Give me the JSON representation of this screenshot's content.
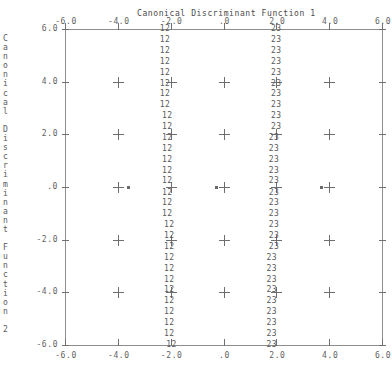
{
  "title": "Canonical Discriminant Function 1",
  "y_axis_caption": "Canonical Discriminant Function 2",
  "y_axis_caption_chars": [
    "C",
    "a",
    "n",
    "o",
    "n",
    "i",
    "c",
    "a",
    "l",
    "",
    "D",
    "i",
    "s",
    "c",
    "r",
    "i",
    "m",
    "i",
    "n",
    "a",
    "n",
    "t",
    "",
    "F",
    "u",
    "n",
    "c",
    "t",
    "i",
    "o",
    "n",
    "",
    "2"
  ],
  "x_tick_labels": [
    "-6.0",
    "-4.0",
    "-2.0",
    ".0",
    "2.0",
    "4.0",
    "6.0"
  ],
  "y_tick_labels": [
    "6.0",
    "4.0",
    "2.0",
    ".0",
    "-2.0",
    "-4.0",
    "-6.0"
  ],
  "x_tick_labels_top": [
    "-6.0",
    "-4.0",
    "-2.0",
    ".0",
    "2.0",
    "4.0",
    "6.0"
  ],
  "symbols": {
    "group_12": "12",
    "group_23": "23",
    "grid_marker": "+",
    "centroid": "*"
  },
  "colors": {
    "axis": "#8d8d8d",
    "tick": "#707070",
    "text": "#5a5a5a",
    "marker": "#6e6e6e",
    "background": "#ffffff"
  },
  "chart_data": {
    "type": "scatter",
    "title": "Canonical Discriminant Function 1",
    "xlabel": "Canonical Discriminant Function 1",
    "ylabel": "Canonical Discriminant Function 2",
    "xlim": [
      -6.0,
      6.0
    ],
    "ylim": [
      -6.0,
      6.0
    ],
    "xticks": [
      -6.0,
      -4.0,
      -2.0,
      0.0,
      2.0,
      4.0,
      6.0
    ],
    "yticks": [
      -6.0,
      -4.0,
      -2.0,
      0.0,
      2.0,
      4.0,
      6.0
    ],
    "grid": true,
    "legend": "none",
    "series": [
      {
        "name": "12",
        "label": "12",
        "description": "Boundary between group 1 and group 2 territory",
        "x": [
          -2.22,
          -2.22,
          -2.22,
          -2.22,
          -2.22,
          -2.22,
          -2.22,
          -2.22,
          -2.14,
          -2.14,
          -2.14,
          -2.14,
          -2.14,
          -2.14,
          -2.14,
          -2.14,
          -2.14,
          -2.14,
          -2.06,
          -2.06,
          -2.06,
          -2.06,
          -2.06,
          -2.06,
          -2.06,
          -2.06,
          -2.06,
          -2.06,
          -2.06,
          -1.98
        ],
        "y": [
          6.0,
          5.59,
          5.17,
          4.76,
          4.34,
          3.93,
          3.52,
          3.1,
          2.69,
          2.28,
          1.86,
          1.45,
          1.03,
          0.62,
          0.21,
          -0.21,
          -0.62,
          -1.03,
          -1.45,
          -1.86,
          -2.28,
          -2.69,
          -3.1,
          -3.52,
          -3.93,
          -4.34,
          -4.76,
          -5.17,
          -5.59,
          -6.0
        ],
        "count": 30
      },
      {
        "name": "23",
        "label": "23",
        "description": "Boundary between group 2 and group 3 territory",
        "x": [
          1.99,
          1.99,
          1.99,
          1.99,
          1.99,
          1.99,
          1.99,
          1.99,
          1.99,
          1.99,
          1.9,
          1.9,
          1.9,
          1.9,
          1.9,
          1.9,
          1.9,
          1.9,
          1.9,
          1.9,
          1.9,
          1.82,
          1.82,
          1.82,
          1.82,
          1.82,
          1.82,
          1.82,
          1.82,
          1.82
        ],
        "y": [
          6.0,
          5.59,
          5.17,
          4.76,
          4.34,
          3.93,
          3.52,
          3.1,
          2.69,
          2.28,
          1.86,
          1.45,
          1.03,
          0.62,
          0.21,
          -0.21,
          -0.62,
          -1.03,
          -1.45,
          -1.86,
          -2.28,
          -2.69,
          -3.1,
          -3.52,
          -3.93,
          -4.34,
          -4.76,
          -5.17,
          -5.59,
          -6.0
        ],
        "count": 30
      },
      {
        "name": "centroids",
        "label": "*",
        "description": "Group centroids plotted at y = 0",
        "x": [
          -3.6,
          -0.3,
          3.7
        ],
        "y": [
          0.0,
          0.0,
          0.0
        ],
        "count": 3
      }
    ],
    "grid_markers": {
      "description": "Plus symbols at interior gridline intersections",
      "x": [
        -4.0,
        -2.0,
        0.0,
        2.0,
        4.0
      ],
      "y": [
        4.0,
        2.0,
        0.0,
        -2.0,
        -4.0
      ]
    }
  }
}
